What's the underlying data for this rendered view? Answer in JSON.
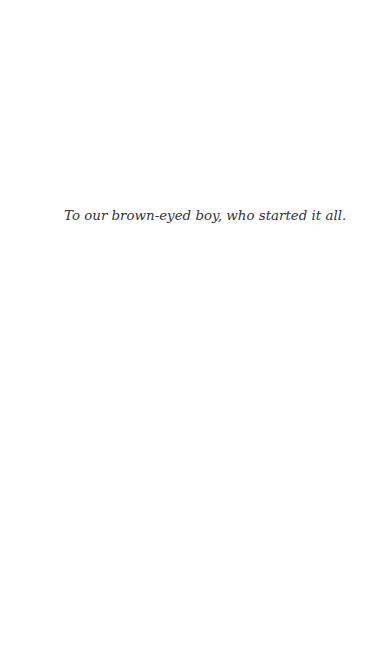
{
  "page": {
    "type": "dedication",
    "background": "#ffffff",
    "text_color": "#333333"
  },
  "dedication": {
    "text": "To our brown-eyed boy, who started it all."
  }
}
